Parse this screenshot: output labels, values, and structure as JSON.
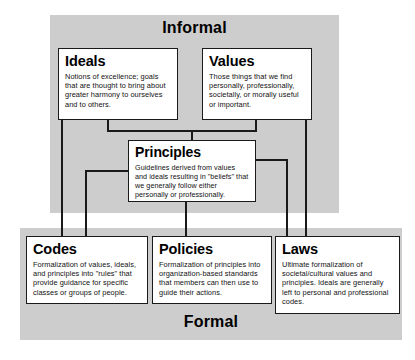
{
  "diagram": {
    "title_informal": "Informal",
    "title_formal": "Formal",
    "nodes": {
      "ideals": {
        "title": "Ideals",
        "body": "Notions of excellence; goals that are thought to bring about greater harmony to ourselves and to others."
      },
      "values": {
        "title": "Values",
        "body": "Those things that we find personally, professionally, societally, or morally useful or important."
      },
      "principles": {
        "title": "Principles",
        "body": "Guidelines derived from values and ideals resulting in \"beliefs\" that we generally follow either personally or professionally."
      },
      "codes": {
        "title": "Codes",
        "body": "Formalization of values, ideals, and principles into \"rules\" that provide guidance for specific classes or groups of people."
      },
      "policies": {
        "title": "Policies",
        "body": "Formalization of principles into organization-based standards that members can then use to guide their actions."
      },
      "laws": {
        "title": "Laws",
        "body": "Ultimate formalization of societal/cultural values and principles. Ideals are generally left to personal and professional codes."
      }
    },
    "colors": {
      "zone_background": "#cdcdcd",
      "node_background": "#ffffff",
      "line": "#1a1a1a",
      "text": "#000000"
    }
  }
}
